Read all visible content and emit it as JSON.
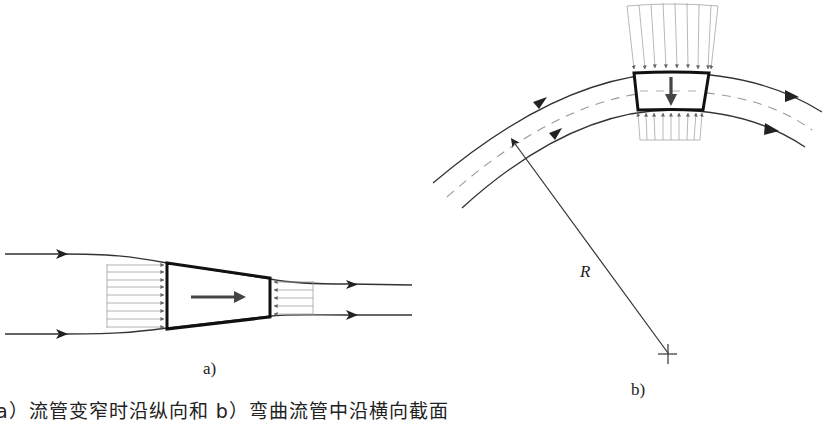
{
  "figure": {
    "panel_a": {
      "label": "a)",
      "description": "Narrowing stream tube with control volume; flow arrow pointing right"
    },
    "panel_b": {
      "label": "b)",
      "radius_label": "R",
      "description": "Curved stream tube with control volume; pressure arrow pointing toward center of curvature"
    },
    "caption": "a）流管变窄时沿纵向和 b）弯曲流管中沿横向截面"
  },
  "colors": {
    "line": "#222222",
    "thin": "#9a9a9a",
    "dash": "#9a9a9a",
    "arrow": "#444444"
  }
}
